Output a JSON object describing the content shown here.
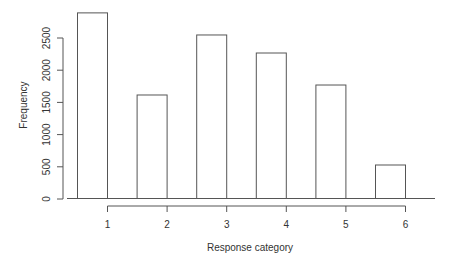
{
  "chart_data": {
    "type": "bar",
    "title": "",
    "xlabel": "Response category",
    "ylabel": "Frequency",
    "categories": [
      "1",
      "2",
      "3",
      "4",
      "5",
      "6"
    ],
    "values": [
      2890,
      1615,
      2547,
      2267,
      1770,
      528
    ],
    "ylim": [
      0,
      2900
    ],
    "yticks": [
      0,
      500,
      1000,
      1500,
      2000,
      2500
    ],
    "ytick_labels": [
      "0",
      "500",
      "1000",
      "1500",
      "2000",
      "2500"
    ],
    "xtick_labels": [
      "1",
      "2",
      "3",
      "4",
      "5",
      "6"
    ],
    "grid": false,
    "legend": null,
    "colors": {
      "bar_fill": "#ffffff",
      "bar_stroke": "#555555",
      "axis": "#555555",
      "text": "#333333"
    }
  }
}
